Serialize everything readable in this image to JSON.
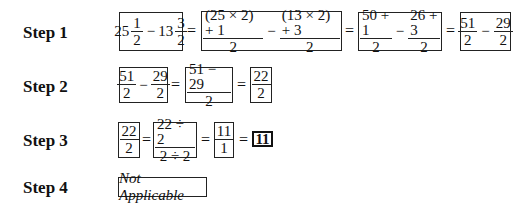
{
  "steps": [
    {
      "label": "Step 1",
      "expr1": {
        "w1": "25",
        "n1": "1",
        "d1": "2",
        "op": "−",
        "w2": "13",
        "n2": "3",
        "d2": "2"
      },
      "expr2": {
        "n1": "(25 × 2) + 1",
        "d1": "2",
        "op": "−",
        "n2": "(13 × 2) + 3",
        "d2": "2"
      },
      "expr3": {
        "n1": "50 + 1",
        "d1": "2",
        "op": "−",
        "n2": "26 + 3",
        "d2": "2"
      },
      "expr4": {
        "n1": "51",
        "d1": "2",
        "op": "−",
        "n2": "29",
        "d2": "2"
      },
      "eq": "="
    },
    {
      "label": "Step 2",
      "expr1": {
        "n1": "51",
        "d1": "2",
        "op": "−",
        "n2": "29",
        "d2": "2"
      },
      "expr2": {
        "n": "51 − 29",
        "d": "2"
      },
      "expr3": {
        "n": "22",
        "d": "2"
      },
      "eq": "="
    },
    {
      "label": "Step 3",
      "expr1": {
        "n": "22",
        "d": "2"
      },
      "expr2": {
        "n": "22 ÷ 2",
        "d": "2 ÷ 2"
      },
      "expr3": {
        "n": "11",
        "d": "1"
      },
      "result": "11",
      "eq": "="
    },
    {
      "label": "Step 4",
      "text": "Not Applicable"
    }
  ]
}
